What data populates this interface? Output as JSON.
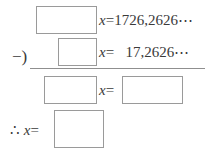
{
  "worksheet": {
    "type": "repeating-decimal-subtraction",
    "rows": [
      {
        "id": "row1",
        "answer_box": "",
        "expression": "x=1726,2626⋯",
        "variable": "x",
        "relation": "=",
        "value": "1726,2626⋯"
      },
      {
        "id": "row2",
        "operator": "−)",
        "answer_box": "",
        "expression": "x=   17,2626⋯",
        "variable": "x",
        "relation": "=",
        "value": "17,2626⋯"
      },
      {
        "id": "row3",
        "answer_box_left": "",
        "expression": "x=",
        "variable": "x",
        "relation": "=",
        "answer_box_right": ""
      },
      {
        "id": "row4",
        "expression": "∴ x=",
        "therefore_symbol": "∴",
        "variable": "x",
        "relation": "=",
        "answer_box": ""
      }
    ]
  },
  "colors": {
    "text": "#3a3a3a",
    "box_border": "#9a9a9a",
    "rule": "#8f8f8f",
    "background": "#ffffff"
  }
}
